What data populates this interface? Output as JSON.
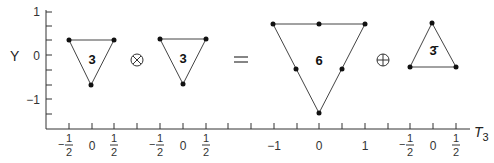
{
  "axes": {
    "y_title": "Y",
    "x_title": "T",
    "x_title_sub": "3",
    "y_ticks": [
      {
        "label": "1",
        "y": 12
      },
      {
        "label": "0",
        "y": 55
      },
      {
        "label": "−1",
        "y": 99
      }
    ]
  },
  "representations": [
    {
      "name": "3",
      "x_ticks": [
        "−½",
        "0",
        "½"
      ]
    },
    {
      "name": "3",
      "x_ticks": [
        "−½",
        "0",
        "½"
      ]
    },
    {
      "name": "6",
      "x_ticks": [
        "−1",
        "0",
        "1"
      ]
    },
    {
      "name": "3̄",
      "x_ticks": [
        "−½",
        "0",
        "½"
      ]
    }
  ],
  "operators": {
    "tensor": "⊗",
    "equals": "=",
    "direct_sum": "⊕"
  },
  "equation": "3 ⊗ 3 = 6 ⊕ 3̄"
}
